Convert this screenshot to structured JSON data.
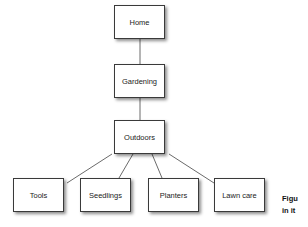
{
  "diagram": {
    "type": "tree",
    "nodes": [
      {
        "id": "home",
        "label": "Home",
        "x": 114,
        "y": 5
      },
      {
        "id": "gardening",
        "label": "Gardening",
        "x": 114,
        "y": 64
      },
      {
        "id": "outdoors",
        "label": "Outdoors",
        "x": 114,
        "y": 120
      },
      {
        "id": "tools",
        "label": "Tools",
        "x": 13,
        "y": 178
      },
      {
        "id": "seedlings",
        "label": "Seedlings",
        "x": 80,
        "y": 178
      },
      {
        "id": "planters",
        "label": "Planters",
        "x": 148,
        "y": 178
      },
      {
        "id": "lawn_care",
        "label": "Lawn care",
        "x": 214,
        "y": 178
      }
    ],
    "edges": [
      [
        "home",
        "gardening"
      ],
      [
        "gardening",
        "outdoors"
      ],
      [
        "outdoors",
        "tools"
      ],
      [
        "outdoors",
        "seedlings"
      ],
      [
        "outdoors",
        "planters"
      ],
      [
        "outdoors",
        "lawn_care"
      ]
    ]
  },
  "caption": {
    "line1": "Figu",
    "line2": "in it"
  }
}
